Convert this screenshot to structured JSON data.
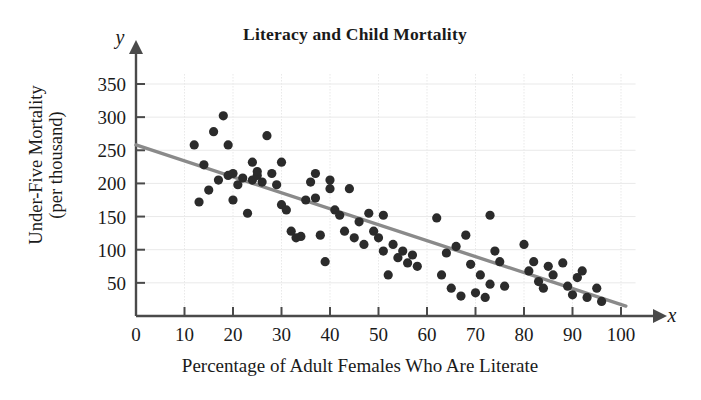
{
  "chart_data": {
    "type": "scatter",
    "title": "Literacy and Child Mortality",
    "xlabel": "Percentage of Adult Females Who Are Literate",
    "ylabel_line1": "Under-Five Mortality",
    "ylabel_line2": "(per thousand)",
    "x_axis_variable": "x",
    "y_axis_variable": "y",
    "xlim": [
      0,
      103
    ],
    "ylim": [
      0,
      365
    ],
    "xticks": [
      0,
      10,
      20,
      30,
      40,
      50,
      60,
      70,
      80,
      90,
      100
    ],
    "yticks": [
      50,
      100,
      150,
      200,
      250,
      300,
      350
    ],
    "grid": true,
    "grid_color": "#e9e9e9",
    "point_color": "#2b2b2b",
    "line_color": "#8a8a8a",
    "axis_color": "#4a4a4a",
    "legend": "none",
    "trendline": {
      "type": "linear-regression",
      "x_start": 0,
      "y_start": 258,
      "x_end": 101,
      "y_end": 15
    },
    "points": [
      [
        12,
        258
      ],
      [
        13,
        172
      ],
      [
        14,
        228
      ],
      [
        15,
        190
      ],
      [
        16,
        278
      ],
      [
        17,
        205
      ],
      [
        18,
        302
      ],
      [
        19,
        212
      ],
      [
        19,
        258
      ],
      [
        20,
        215
      ],
      [
        20,
        175
      ],
      [
        21,
        198
      ],
      [
        22,
        208
      ],
      [
        23,
        155
      ],
      [
        24,
        232
      ],
      [
        24,
        205
      ],
      [
        25,
        212
      ],
      [
        25,
        218
      ],
      [
        26,
        202
      ],
      [
        27,
        272
      ],
      [
        28,
        215
      ],
      [
        29,
        198
      ],
      [
        30,
        232
      ],
      [
        30,
        168
      ],
      [
        31,
        160
      ],
      [
        32,
        128
      ],
      [
        33,
        118
      ],
      [
        34,
        120
      ],
      [
        35,
        175
      ],
      [
        36,
        202
      ],
      [
        37,
        215
      ],
      [
        37,
        178
      ],
      [
        38,
        122
      ],
      [
        39,
        82
      ],
      [
        40,
        205
      ],
      [
        40,
        192
      ],
      [
        41,
        160
      ],
      [
        42,
        152
      ],
      [
        43,
        128
      ],
      [
        44,
        192
      ],
      [
        45,
        118
      ],
      [
        46,
        142
      ],
      [
        47,
        108
      ],
      [
        48,
        155
      ],
      [
        49,
        128
      ],
      [
        50,
        118
      ],
      [
        51,
        152
      ],
      [
        51,
        98
      ],
      [
        52,
        62
      ],
      [
        53,
        108
      ],
      [
        54,
        88
      ],
      [
        55,
        98
      ],
      [
        56,
        80
      ],
      [
        57,
        92
      ],
      [
        58,
        75
      ],
      [
        62,
        148
      ],
      [
        63,
        62
      ],
      [
        64,
        95
      ],
      [
        65,
        42
      ],
      [
        66,
        105
      ],
      [
        67,
        30
      ],
      [
        68,
        122
      ],
      [
        69,
        78
      ],
      [
        70,
        35
      ],
      [
        71,
        62
      ],
      [
        72,
        28
      ],
      [
        73,
        152
      ],
      [
        73,
        48
      ],
      [
        74,
        98
      ],
      [
        75,
        82
      ],
      [
        76,
        45
      ],
      [
        80,
        108
      ],
      [
        81,
        68
      ],
      [
        82,
        82
      ],
      [
        83,
        52
      ],
      [
        84,
        42
      ],
      [
        85,
        75
      ],
      [
        86,
        62
      ],
      [
        88,
        80
      ],
      [
        89,
        45
      ],
      [
        90,
        32
      ],
      [
        91,
        58
      ],
      [
        92,
        68
      ],
      [
        93,
        28
      ],
      [
        95,
        42
      ],
      [
        96,
        22
      ]
    ]
  }
}
